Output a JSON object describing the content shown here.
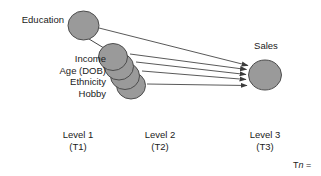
{
  "diagram": {
    "title_visible": false,
    "background_color": "#ffffff",
    "node_fill_color": "#9a9a9a",
    "node_stroke_color": "#4d4d4d",
    "edge_color": "#3b3b3b",
    "text_color": "#1a1a1a",
    "nodes": {
      "education": {
        "label": "Education"
      },
      "sales": {
        "label": "Sales"
      },
      "predictors": [
        {
          "label": "Income"
        },
        {
          "label": "Age (DOB)"
        },
        {
          "label": "Ethnicity"
        },
        {
          "label": "Hobby"
        }
      ]
    },
    "levels": [
      {
        "name": "Level 1",
        "time": "(T1)"
      },
      {
        "name": "Level 2",
        "time": "(T2)"
      },
      {
        "name": "Level 3",
        "time": "(T3)"
      }
    ],
    "footnote": {
      "prefix": "T",
      "italic": "n",
      "suffix": " = "
    }
  }
}
